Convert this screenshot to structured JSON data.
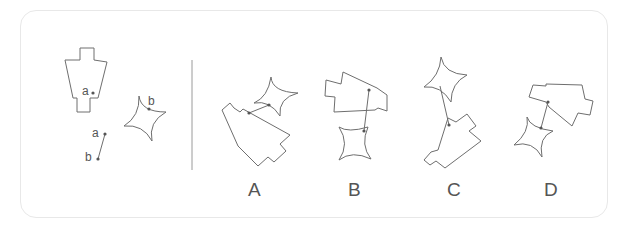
{
  "puzzle": {
    "type": "spatial-reasoning",
    "question_panel": {
      "shape1_point_label": "a",
      "shape2_point_label": "b",
      "rod_top_label": "a",
      "rod_bottom_label": "b"
    },
    "options": [
      {
        "label": "A"
      },
      {
        "label": "B"
      },
      {
        "label": "C"
      },
      {
        "label": "D"
      }
    ]
  },
  "colors": {
    "stroke": "#6e6e6e",
    "border": "#e8e8e8",
    "text": "#555555"
  }
}
